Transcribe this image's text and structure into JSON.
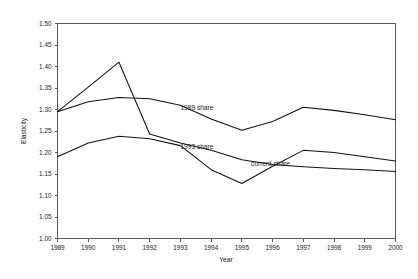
{
  "chart_data": {
    "type": "line",
    "title": "",
    "xlabel": "Year",
    "ylabel": "Elasticity",
    "x": [
      1989,
      1990,
      1991,
      1992,
      1993,
      1994,
      1995,
      1996,
      1997,
      1998,
      1999,
      2000
    ],
    "xtick_labels": [
      "1989",
      "1990",
      "1991",
      "1992",
      "1993",
      "1994",
      "1995",
      "1996",
      "1997",
      "1998",
      "1999",
      "2000"
    ],
    "ytick_labels": [
      "1.00",
      "1.05",
      "1.10",
      "1.15",
      "1.20",
      "1.25",
      "1.30",
      "1.35",
      "1.40",
      "1.45",
      "1.50"
    ],
    "ytick_values": [
      1.0,
      1.05,
      1.1,
      1.15,
      1.2,
      1.25,
      1.3,
      1.35,
      1.4,
      1.45,
      1.5
    ],
    "ylim": [
      1.0,
      1.5
    ],
    "xlim": [
      1989,
      2000
    ],
    "grid": false,
    "legend": "inline-labels",
    "series": [
      {
        "name": "1989 share",
        "label": "1989 share",
        "label_x": 1993.0,
        "label_y": 1.298,
        "values": [
          1.295,
          1.352,
          1.41,
          1.243,
          1.222,
          1.205,
          1.183,
          1.172,
          1.167,
          1.163,
          1.16,
          1.156
        ]
      },
      {
        "name": "1993 share",
        "label": "1993 share",
        "label_x": 1993.0,
        "label_y": 1.208,
        "values": [
          1.295,
          1.318,
          1.328,
          1.325,
          1.31,
          1.278,
          1.252,
          1.272,
          1.305,
          1.298,
          1.288,
          1.276
        ]
      },
      {
        "name": "current share",
        "label": "current share",
        "label_x": 1995.3,
        "label_y": 1.168,
        "values": [
          1.19,
          1.222,
          1.238,
          1.232,
          1.216,
          1.16,
          1.128,
          1.168,
          1.205,
          1.2,
          1.19,
          1.18
        ]
      }
    ]
  },
  "axis": {
    "y_title": "Elasticity",
    "x_title": "Year"
  }
}
